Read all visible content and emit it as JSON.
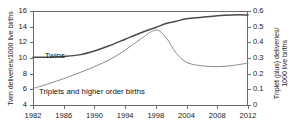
{
  "chart_data": {
    "type": "line",
    "title": "",
    "xlabel": "",
    "x": [
      1982,
      1986,
      1990,
      1994,
      1998,
      2004,
      2008,
      2012
    ],
    "xtick_labels": [
      "1982",
      "1986",
      "1990",
      "1994",
      "1998",
      "2004",
      "2008",
      "2012"
    ],
    "grid": false,
    "legend_position": "inline-annotations",
    "axes": {
      "left": {
        "label": "Twin deliveries/1000 live births",
        "ticks": [
          4,
          6,
          8,
          10,
          12,
          14,
          16
        ],
        "tick_labels": [
          "4",
          "6",
          "8",
          "10",
          "12",
          "14",
          "16"
        ],
        "ylim": [
          4,
          16
        ]
      },
      "right": {
        "label_line1": "Triplet (plus) deliveries/",
        "label_line2": "1000 live births",
        "ticks": [
          0,
          0.1,
          0.2,
          0.3,
          0.4,
          0.5,
          0.6
        ],
        "tick_labels": [
          "0",
          "0.1",
          "0.2",
          "0.3",
          "0.4",
          "0.5",
          "0.6"
        ],
        "ylim": [
          0,
          0.6
        ]
      }
    },
    "series": [
      {
        "name": "Twins",
        "axis": "left",
        "color": "#4a4a4a",
        "annotation": "Twins",
        "x": [
          1982,
          1984,
          1986,
          1988,
          1990,
          1992,
          1994,
          1996,
          1998,
          2000,
          2002,
          2004,
          2006,
          2008,
          2010,
          2012
        ],
        "values": [
          10.1,
          10.1,
          10.2,
          10.4,
          10.9,
          11.6,
          12.4,
          13.2,
          13.9,
          14.4,
          14.7,
          15.0,
          15.2,
          15.4,
          15.5,
          15.5
        ]
      },
      {
        "name": "Triplets and higher order births",
        "axis": "right",
        "color": "#8c8c8c",
        "annotation": "Triplets and higher order births",
        "x": [
          1982,
          1984,
          1986,
          1988,
          1990,
          1992,
          1994,
          1996,
          1998,
          2000,
          2002,
          2004,
          2006,
          2008,
          2010,
          2012
        ],
        "values": [
          0.105,
          0.135,
          0.168,
          0.205,
          0.245,
          0.29,
          0.35,
          0.42,
          0.478,
          0.43,
          0.33,
          0.272,
          0.25,
          0.245,
          0.252,
          0.268
        ]
      }
    ]
  }
}
